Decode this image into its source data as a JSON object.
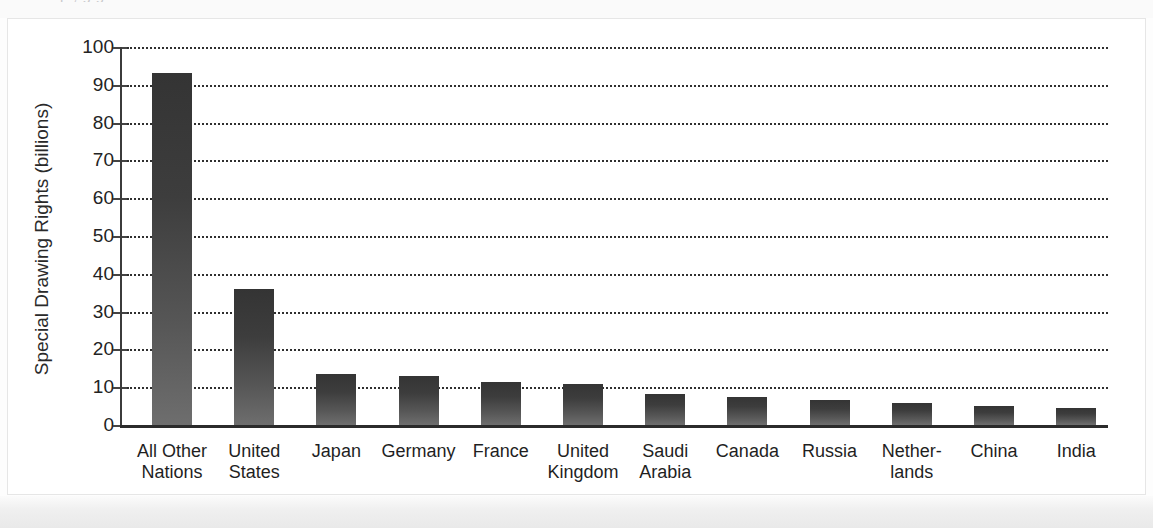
{
  "figure": {
    "cropped_title_fragment": "p    , g g",
    "background_color": "#ffffff",
    "bar_color_top": "#343434",
    "bar_color_bottom": "#6e6e6e",
    "axis_color": "#2b2b2b",
    "gridline_color": "#2f2f2f"
  },
  "chart_data": {
    "type": "bar",
    "title": "",
    "xlabel": "",
    "ylabel": "Special Drawing Rights (billions)",
    "categories": [
      "All Other Nations",
      "United States",
      "Japan",
      "Germany",
      "France",
      "United Kingdom",
      "Saudi Arabia",
      "Canada",
      "Russia",
      "Netherlands",
      "China",
      "India"
    ],
    "category_lines": [
      [
        "All Other",
        "Nations"
      ],
      [
        "United",
        "States"
      ],
      [
        "Japan",
        ""
      ],
      [
        "Germany",
        ""
      ],
      [
        "France",
        ""
      ],
      [
        "United",
        "Kingdom"
      ],
      [
        "Saudi",
        "Arabia"
      ],
      [
        "Canada",
        ""
      ],
      [
        "Russia",
        ""
      ],
      [
        "Nether-",
        "lands"
      ],
      [
        "China",
        ""
      ],
      [
        "India",
        ""
      ]
    ],
    "values": [
      93,
      36,
      13.5,
      13,
      11.3,
      10.8,
      8.2,
      7.4,
      6.6,
      5.8,
      5,
      4.5
    ],
    "ylim": [
      0,
      100
    ],
    "ytick_labels": [
      "100",
      "90",
      "80",
      "70",
      "60",
      "50",
      "40",
      "30",
      "20",
      "10",
      "0"
    ],
    "ytick_values": [
      100,
      90,
      80,
      70,
      60,
      50,
      40,
      30,
      20,
      10,
      0
    ],
    "grid": true,
    "grid_style": "dotted-horizontal",
    "legend": "none"
  }
}
